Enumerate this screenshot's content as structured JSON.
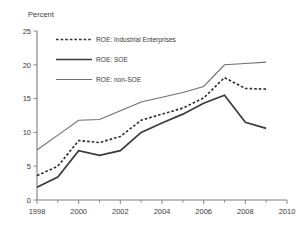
{
  "chart_data": {
    "type": "line",
    "title": "",
    "ylabel": "Percent",
    "xlabel": "",
    "ylim": [
      0,
      25
    ],
    "xlim": [
      1998,
      2010
    ],
    "yticks": [
      "0",
      "5",
      "10",
      "15",
      "20",
      "25"
    ],
    "ytick_values": [
      0,
      5,
      10,
      15,
      20,
      25
    ],
    "xticks": [
      "1998",
      "2000",
      "2002",
      "2004",
      "2006",
      "2008",
      "2010"
    ],
    "xtick_values": [
      1998,
      2000,
      2002,
      2004,
      2006,
      2008,
      2010
    ],
    "minor_xticks": [
      1999,
      2001,
      2003,
      2005,
      2007,
      2009
    ],
    "grid": false,
    "legend_position": "upper left inside",
    "x": [
      1998,
      1999,
      2000,
      2001,
      2002,
      2003,
      2004,
      2005,
      2006,
      2007,
      2008,
      2009
    ],
    "series": [
      {
        "name": "ROE: Industrial Enterprises",
        "style": "dotted",
        "color": "#2f2f2f",
        "values": [
          3.6,
          5.0,
          8.8,
          8.5,
          9.4,
          11.8,
          12.7,
          13.6,
          15.1,
          18.1,
          16.5,
          16.4
        ]
      },
      {
        "name": "ROE: SOE",
        "style": "solid-thick",
        "color": "#3b3b3b",
        "values": [
          1.9,
          3.4,
          7.3,
          6.6,
          7.3,
          10.0,
          11.4,
          12.7,
          14.3,
          15.5,
          11.5,
          10.6
        ]
      },
      {
        "name": "ROE: non-SOE",
        "style": "solid-thin",
        "color": "#6f6f6f",
        "values": [
          7.4,
          9.6,
          11.8,
          11.9,
          13.2,
          14.5,
          15.2,
          15.9,
          16.8,
          20.0,
          20.2,
          20.4
        ]
      }
    ]
  },
  "axis": {
    "ylabel_title": "Percent",
    "ytick_labels": [
      "25",
      "20",
      "15",
      "10",
      "5",
      "0"
    ],
    "xtick_labels": [
      "1998",
      "2000",
      "2002",
      "2004",
      "2006",
      "2008",
      "2010"
    ]
  },
  "legend": {
    "items": [
      {
        "label": "ROE: Industrial Enterprises"
      },
      {
        "label": "ROE: SOE"
      },
      {
        "label": "ROE: non-SOE"
      }
    ]
  },
  "colors": {
    "soe": "#3b3b3b",
    "non_soe": "#6f6f6f",
    "industrial": "#2f2f2f",
    "axis": "#7d7d7d",
    "text": "#3a3a3a",
    "background": "#ffffff"
  }
}
